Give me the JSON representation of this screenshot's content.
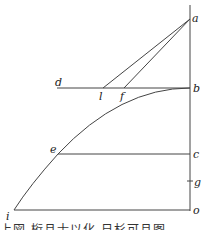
{
  "diagram": {
    "labels": {
      "a": "a",
      "b": "b",
      "c": "c",
      "d": "d",
      "e": "e",
      "f": "f",
      "g": "g",
      "i": "i",
      "l": "l",
      "o": "o"
    },
    "caption_partial": "上図 桁且士以化 日杉可且图"
  }
}
